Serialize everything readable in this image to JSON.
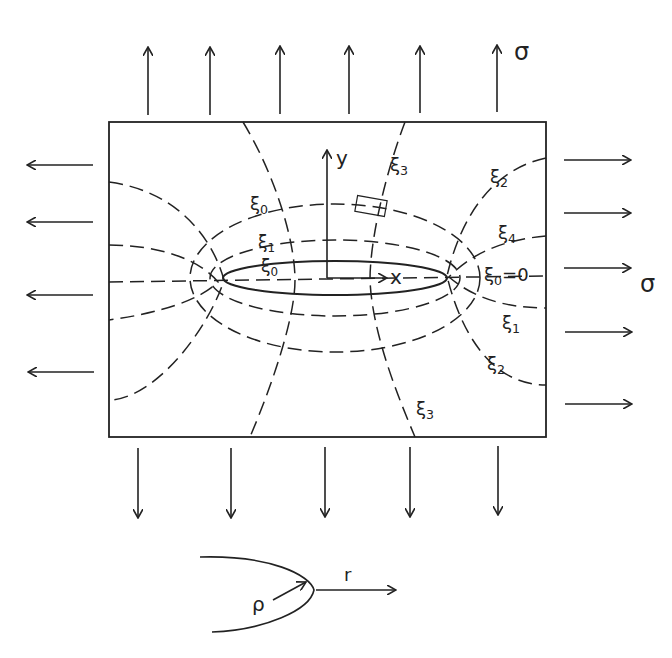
{
  "diagram": {
    "stroke_color": "#222222",
    "background": "#ffffff",
    "plate": {
      "x": 109,
      "y": 122,
      "width": 437,
      "height": 315
    },
    "hole": {
      "cx": 335,
      "cy": 278,
      "rx": 112,
      "ry": 17
    },
    "load_labels": {
      "top": "σ",
      "right": "σ"
    },
    "axes": {
      "x_label": "x",
      "y_label": "y"
    },
    "curve_labels": {
      "xi3_top": {
        "sym": "ξ",
        "sub": "3"
      },
      "xi2_top_right": {
        "sym": "ξ",
        "sub": "2"
      },
      "xi0_upper_left": {
        "sym": "ξ",
        "sub": "0"
      },
      "xi4_right": {
        "sym": "ξ",
        "sub": "4"
      },
      "xi1_inner": {
        "sym": "ξ",
        "sub": "1"
      },
      "xi0_inner": {
        "sym": "ξ",
        "sub": "0"
      },
      "xi0_eq_zero": {
        "sym": "ξ",
        "sub": "0",
        "suffix": "=0"
      },
      "xi1_right": {
        "sym": "ξ",
        "sub": "1"
      },
      "xi2_bottom_right": {
        "sym": "ξ",
        "sub": "2"
      },
      "xi3_bottom": {
        "sym": "ξ",
        "sub": "3"
      }
    },
    "arrows": {
      "top_x": [
        148,
        210,
        280,
        349,
        420,
        497
      ],
      "bottom_x": [
        138,
        231,
        325,
        410,
        498
      ],
      "left_y": [
        165,
        222,
        295,
        372
      ],
      "right_y": [
        160,
        213,
        268,
        332,
        404
      ]
    },
    "tip_detail": {
      "radius_label": "ρ",
      "distance_label": "r"
    }
  }
}
